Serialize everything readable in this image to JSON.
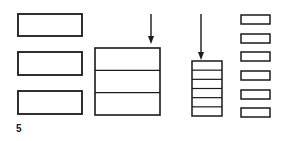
{
  "figure": {
    "label": "5",
    "stroke_color": "#1a1a1a",
    "background": "#ffffff",
    "separate_blocks_large": {
      "count": 3,
      "x": 18,
      "w": 64,
      "rects": [
        {
          "y": 14,
          "h": 22
        },
        {
          "y": 52,
          "h": 23
        },
        {
          "y": 91,
          "h": 23
        }
      ]
    },
    "stacked_block_large": {
      "x": 95,
      "y": 48,
      "w": 65,
      "h": 67,
      "layers": 3
    },
    "arrows": [
      {
        "name": "compression-arrow-1",
        "x": 151,
        "y1": 14,
        "y2": 44
      },
      {
        "name": "compression-arrow-2",
        "x": 201,
        "y1": 14,
        "y2": 60
      }
    ],
    "stacked_block_small": {
      "x": 192,
      "y": 61,
      "w": 30,
      "h": 55,
      "layers": 6
    },
    "separate_blocks_small": {
      "count": 6,
      "x": 241,
      "w": 29,
      "rects": [
        {
          "y": 15,
          "h": 9
        },
        {
          "y": 34,
          "h": 9
        },
        {
          "y": 52,
          "h": 9
        },
        {
          "y": 71,
          "h": 9
        },
        {
          "y": 90,
          "h": 9
        },
        {
          "y": 108,
          "h": 9
        }
      ]
    }
  }
}
